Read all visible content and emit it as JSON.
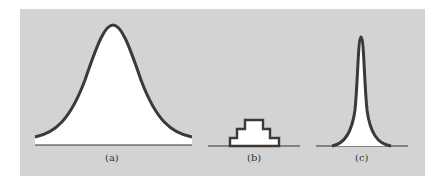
{
  "figure": {
    "background_color": "#d3d3d3",
    "curve_color": "#3a3a3a",
    "fill_color": "#ffffff",
    "panels": [
      {
        "id": "a",
        "label": "(a)",
        "shape": "wide bell-shaped distribution"
      },
      {
        "id": "b",
        "label": "(b)",
        "shape": "stepped histogram-like distribution"
      },
      {
        "id": "c",
        "label": "(c)",
        "shape": "narrow sharply peaked distribution"
      }
    ]
  }
}
